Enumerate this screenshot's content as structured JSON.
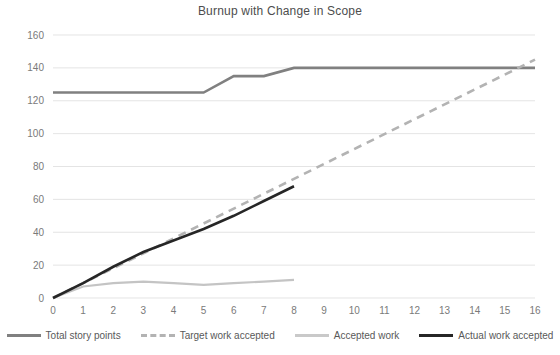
{
  "chart_data": {
    "type": "line",
    "title": "Burnup with Change in Scope",
    "xlabel": "",
    "ylabel": "",
    "xlim": [
      0,
      16
    ],
    "ylim": [
      0,
      160
    ],
    "grid": "horizontal",
    "legend_position": "bottom",
    "x": [
      0,
      1,
      2,
      3,
      4,
      5,
      6,
      7,
      8,
      9,
      10,
      11,
      12,
      13,
      14,
      15,
      16
    ],
    "xtick_labels": [
      "0",
      "1",
      "2",
      "3",
      "4",
      "5",
      "6",
      "7",
      "8",
      "9",
      "10",
      "11",
      "12",
      "13",
      "14",
      "15",
      "16"
    ],
    "ytick_labels": [
      "0",
      "20",
      "40",
      "60",
      "80",
      "100",
      "120",
      "140",
      "160"
    ],
    "ytick_values": [
      0,
      20,
      40,
      60,
      80,
      100,
      120,
      140,
      160
    ],
    "series": [
      {
        "name": "Total story points",
        "color": "#808080",
        "style": "solid",
        "width": 2.6,
        "x": [
          0,
          1,
          2,
          3,
          4,
          5,
          6,
          7,
          8,
          9,
          10,
          11,
          12,
          13,
          14,
          15,
          16
        ],
        "values": [
          125,
          125,
          125,
          125,
          125,
          125,
          135,
          135,
          140,
          140,
          140,
          140,
          140,
          140,
          140,
          140,
          140
        ]
      },
      {
        "name": "Target work accepted",
        "color": "#b3b3b3",
        "style": "dashed",
        "width": 2.6,
        "x": [
          0,
          16
        ],
        "values": [
          0,
          145
        ]
      },
      {
        "name": "Accepted work",
        "color": "#c4c4c4",
        "style": "solid",
        "width": 2.2,
        "x": [
          0,
          1,
          2,
          3,
          4,
          5,
          6,
          7,
          8
        ],
        "values": [
          0,
          7,
          9,
          10,
          9,
          8,
          9,
          10,
          11
        ]
      },
      {
        "name": "Actual work accepted",
        "color": "#262626",
        "style": "solid",
        "width": 2.6,
        "x": [
          0,
          1,
          2,
          3,
          4,
          5,
          6,
          7,
          8
        ],
        "values": [
          0,
          9,
          19,
          28,
          35,
          42,
          50,
          59,
          68
        ]
      }
    ]
  },
  "legend": {
    "items": [
      {
        "label": "Total story points",
        "color": "#808080",
        "style": "solid"
      },
      {
        "label": "Target work accepted",
        "color": "#b3b3b3",
        "style": "dashed"
      },
      {
        "label": "Accepted work",
        "color": "#c9c9c9",
        "style": "solid"
      },
      {
        "label": "Actual work accepted",
        "color": "#262626",
        "style": "solid"
      }
    ]
  }
}
